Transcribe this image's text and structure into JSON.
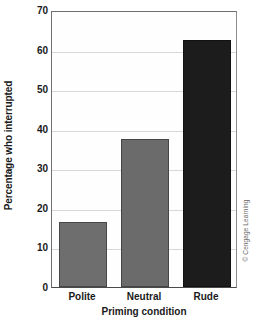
{
  "chart_data": {
    "type": "bar",
    "title": "",
    "xlabel": "Priming condition",
    "ylabel": "Percentage who interrupted",
    "categories": [
      "Polite",
      "Neutral",
      "Rude"
    ],
    "values": [
      16.5,
      37.5,
      62.5
    ],
    "ylim": [
      0,
      70
    ],
    "yticks": [
      0,
      10,
      20,
      30,
      40,
      50,
      60,
      70
    ],
    "ytick_labels": [
      "0",
      "10",
      "20",
      "30",
      "40",
      "50",
      "60",
      "70"
    ],
    "grid": true,
    "grid_axis": "y",
    "legend": false,
    "bar_colors": [
      "#6e6e6e",
      "#6b6b6b",
      "#1c1c1c"
    ]
  },
  "credit": {
    "text": "© Cengage Learning"
  }
}
